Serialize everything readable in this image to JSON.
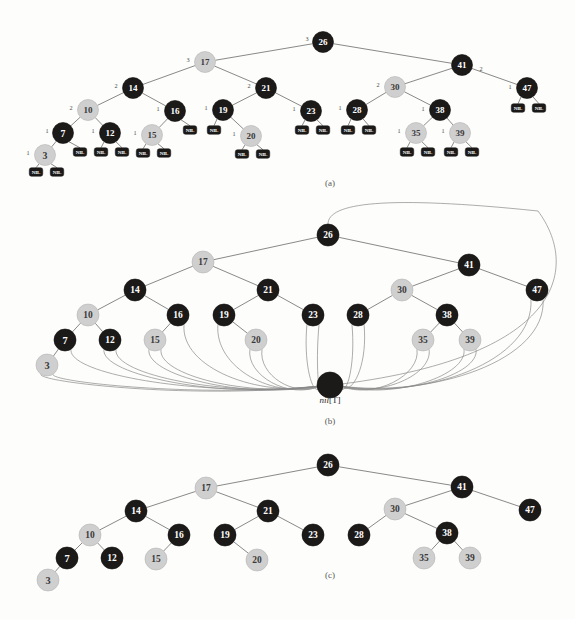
{
  "figure": {
    "captions": [
      {
        "id": "caption-a",
        "text": "(a)",
        "x": 330,
        "y": 186
      },
      {
        "id": "caption-b",
        "text": "(b)",
        "x": 330,
        "y": 424
      },
      {
        "id": "caption-c",
        "text": "(c)",
        "x": 330,
        "y": 578
      }
    ],
    "sentinel_label": {
      "italic_part": "nil",
      "bracket_part": "[T]",
      "x": 330,
      "y": 403
    },
    "colors": {
      "black_node": "#1c1a19",
      "red_node": "#cfcfcf",
      "edge": "#6b6b6b",
      "nil_arc": "#8a8a8a",
      "page_background": "#fdfdfb",
      "black_text": "#ffffff",
      "red_text": "#3a3a3a",
      "bh_text": "#4a4a4a"
    },
    "nil_text": "NIL"
  },
  "panel_a": {
    "name": "panel-a-tree-with-nil-leaves",
    "node_radius": 10.5,
    "nodes": [
      {
        "key": "26",
        "color": "black",
        "x": 323,
        "y": 42,
        "bh": "3",
        "bh_x": 307,
        "bh_y": 38
      },
      {
        "key": "17",
        "color": "red",
        "x": 205,
        "y": 62,
        "bh": "3",
        "bh_x": 188,
        "bh_y": 59
      },
      {
        "key": "41",
        "color": "black",
        "x": 462,
        "y": 65,
        "bh": "2",
        "bh_x": 481,
        "bh_y": 68
      },
      {
        "key": "14",
        "color": "black",
        "x": 133,
        "y": 88,
        "bh": "2",
        "bh_x": 116,
        "bh_y": 85
      },
      {
        "key": "21",
        "color": "black",
        "x": 266,
        "y": 88,
        "bh": "2",
        "bh_x": 249,
        "bh_y": 85
      },
      {
        "key": "30",
        "color": "red",
        "x": 395,
        "y": 87,
        "bh": "2",
        "bh_x": 378,
        "bh_y": 84
      },
      {
        "key": "47",
        "color": "black",
        "x": 527,
        "y": 88,
        "bh": "1",
        "bh_x": 510,
        "bh_y": 86
      },
      {
        "key": "10",
        "color": "red",
        "x": 88,
        "y": 110,
        "bh": "2",
        "bh_x": 71,
        "bh_y": 107
      },
      {
        "key": "16",
        "color": "black",
        "x": 175,
        "y": 111,
        "bh": "1",
        "bh_x": 158,
        "bh_y": 108
      },
      {
        "key": "19",
        "color": "black",
        "x": 223,
        "y": 110,
        "bh": "1",
        "bh_x": 206,
        "bh_y": 107
      },
      {
        "key": "23",
        "color": "black",
        "x": 311,
        "y": 111,
        "bh": "1",
        "bh_x": 294,
        "bh_y": 108
      },
      {
        "key": "28",
        "color": "black",
        "x": 357,
        "y": 110,
        "bh": "1",
        "bh_x": 340,
        "bh_y": 107
      },
      {
        "key": "38",
        "color": "black",
        "x": 440,
        "y": 110,
        "bh": "1",
        "bh_x": 423,
        "bh_y": 108
      },
      {
        "key": "7",
        "color": "black",
        "x": 63,
        "y": 133,
        "bh": "1",
        "bh_x": 47,
        "bh_y": 130
      },
      {
        "key": "12",
        "color": "black",
        "x": 110,
        "y": 133,
        "bh": "1",
        "bh_x": 93,
        "bh_y": 130
      },
      {
        "key": "15",
        "color": "red",
        "x": 152,
        "y": 135,
        "bh": "1",
        "bh_x": 135,
        "bh_y": 132
      },
      {
        "key": "20",
        "color": "red",
        "x": 251,
        "y": 136,
        "bh": "1",
        "bh_x": 234,
        "bh_y": 133
      },
      {
        "key": "35",
        "color": "red",
        "x": 416,
        "y": 133,
        "bh": "1",
        "bh_x": 399,
        "bh_y": 130
      },
      {
        "key": "39",
        "color": "red",
        "x": 460,
        "y": 133,
        "bh": "1",
        "bh_x": 443,
        "bh_y": 130
      },
      {
        "key": "3",
        "color": "red",
        "x": 45,
        "y": 155,
        "bh": "1",
        "bh_x": 28,
        "bh_y": 152
      }
    ],
    "edges": [
      [
        "26",
        "17"
      ],
      [
        "26",
        "41"
      ],
      [
        "17",
        "14"
      ],
      [
        "17",
        "21"
      ],
      [
        "41",
        "30"
      ],
      [
        "41",
        "47"
      ],
      [
        "14",
        "10"
      ],
      [
        "14",
        "16"
      ],
      [
        "21",
        "19"
      ],
      [
        "21",
        "23"
      ],
      [
        "30",
        "28"
      ],
      [
        "30",
        "38"
      ],
      [
        "10",
        "7"
      ],
      [
        "10",
        "12"
      ],
      [
        "16",
        "15"
      ],
      [
        "19",
        "20"
      ],
      [
        "38",
        "35"
      ],
      [
        "38",
        "39"
      ],
      [
        "7",
        "3"
      ]
    ],
    "nil_leaves": [
      {
        "parent": "3",
        "side": "left",
        "x": 36,
        "y": 172
      },
      {
        "parent": "3",
        "side": "right",
        "x": 57,
        "y": 172
      },
      {
        "parent": "7",
        "side": "right",
        "x": 80,
        "y": 152
      },
      {
        "parent": "12",
        "side": "left",
        "x": 101,
        "y": 152
      },
      {
        "parent": "12",
        "side": "right",
        "x": 122,
        "y": 152
      },
      {
        "parent": "15",
        "side": "left",
        "x": 143,
        "y": 153
      },
      {
        "parent": "15",
        "side": "right",
        "x": 164,
        "y": 153
      },
      {
        "parent": "16",
        "side": "right",
        "x": 190,
        "y": 130
      },
      {
        "parent": "19",
        "side": "left",
        "x": 214,
        "y": 130
      },
      {
        "parent": "20",
        "side": "left",
        "x": 242,
        "y": 154
      },
      {
        "parent": "20",
        "side": "right",
        "x": 263,
        "y": 154
      },
      {
        "parent": "23",
        "side": "left",
        "x": 302,
        "y": 130
      },
      {
        "parent": "23",
        "side": "right",
        "x": 323,
        "y": 130
      },
      {
        "parent": "28",
        "side": "left",
        "x": 348,
        "y": 130
      },
      {
        "parent": "28",
        "side": "right",
        "x": 369,
        "y": 130
      },
      {
        "parent": "35",
        "side": "left",
        "x": 407,
        "y": 152
      },
      {
        "parent": "35",
        "side": "right",
        "x": 428,
        "y": 152
      },
      {
        "parent": "39",
        "side": "left",
        "x": 451,
        "y": 152
      },
      {
        "parent": "39",
        "side": "right",
        "x": 472,
        "y": 152
      },
      {
        "parent": "47",
        "side": "left",
        "x": 518,
        "y": 108
      },
      {
        "parent": "47",
        "side": "right",
        "x": 539,
        "y": 108
      }
    ]
  },
  "panel_b": {
    "name": "panel-b-tree-with-sentinel",
    "node_radius": 11,
    "sentinel": {
      "x": 330,
      "y": 385,
      "radius": 13,
      "label": "nil[T]"
    },
    "nodes": [
      {
        "key": "26",
        "color": "black",
        "x": 328,
        "y": 235
      },
      {
        "key": "17",
        "color": "red",
        "x": 203,
        "y": 262
      },
      {
        "key": "41",
        "color": "black",
        "x": 469,
        "y": 265
      },
      {
        "key": "14",
        "color": "black",
        "x": 135,
        "y": 290
      },
      {
        "key": "21",
        "color": "black",
        "x": 268,
        "y": 290
      },
      {
        "key": "30",
        "color": "red",
        "x": 402,
        "y": 290
      },
      {
        "key": "47",
        "color": "black",
        "x": 537,
        "y": 290
      },
      {
        "key": "10",
        "color": "red",
        "x": 88,
        "y": 315
      },
      {
        "key": "16",
        "color": "black",
        "x": 178,
        "y": 315
      },
      {
        "key": "19",
        "color": "black",
        "x": 224,
        "y": 315
      },
      {
        "key": "23",
        "color": "black",
        "x": 313,
        "y": 315
      },
      {
        "key": "28",
        "color": "black",
        "x": 358,
        "y": 315
      },
      {
        "key": "38",
        "color": "black",
        "x": 447,
        "y": 315
      },
      {
        "key": "7",
        "color": "black",
        "x": 65,
        "y": 340
      },
      {
        "key": "12",
        "color": "black",
        "x": 110,
        "y": 340
      },
      {
        "key": "15",
        "color": "red",
        "x": 155,
        "y": 340
      },
      {
        "key": "20",
        "color": "red",
        "x": 256,
        "y": 340
      },
      {
        "key": "35",
        "color": "red",
        "x": 423,
        "y": 340
      },
      {
        "key": "39",
        "color": "red",
        "x": 470,
        "y": 340
      },
      {
        "key": "3",
        "color": "red",
        "x": 47,
        "y": 365
      }
    ],
    "edges": [
      [
        "26",
        "17"
      ],
      [
        "26",
        "41"
      ],
      [
        "17",
        "14"
      ],
      [
        "17",
        "21"
      ],
      [
        "41",
        "30"
      ],
      [
        "41",
        "47"
      ],
      [
        "14",
        "10"
      ],
      [
        "14",
        "16"
      ],
      [
        "21",
        "19"
      ],
      [
        "21",
        "23"
      ],
      [
        "30",
        "28"
      ],
      [
        "30",
        "38"
      ],
      [
        "10",
        "7"
      ],
      [
        "10",
        "12"
      ],
      [
        "16",
        "15"
      ],
      [
        "19",
        "20"
      ],
      [
        "38",
        "35"
      ],
      [
        "38",
        "39"
      ],
      [
        "7",
        "3"
      ]
    ],
    "sentinel_links": [
      {
        "from": "3",
        "side": "left"
      },
      {
        "from": "3",
        "side": "right"
      },
      {
        "from": "7",
        "side": "right"
      },
      {
        "from": "12",
        "side": "left"
      },
      {
        "from": "12",
        "side": "right"
      },
      {
        "from": "15",
        "side": "left"
      },
      {
        "from": "15",
        "side": "right"
      },
      {
        "from": "16",
        "side": "right"
      },
      {
        "from": "19",
        "side": "left"
      },
      {
        "from": "20",
        "side": "left"
      },
      {
        "from": "20",
        "side": "right"
      },
      {
        "from": "23",
        "side": "left"
      },
      {
        "from": "23",
        "side": "right"
      },
      {
        "from": "28",
        "side": "left"
      },
      {
        "from": "28",
        "side": "right"
      },
      {
        "from": "35",
        "side": "left"
      },
      {
        "from": "35",
        "side": "right"
      },
      {
        "from": "39",
        "side": "left"
      },
      {
        "from": "39",
        "side": "right"
      },
      {
        "from": "47",
        "side": "left"
      },
      {
        "from": "47",
        "side": "right"
      }
    ],
    "root_parent_link": {
      "from": "26",
      "note": "root parent points to sentinel via top arc"
    }
  },
  "panel_c": {
    "name": "panel-c-tree-nil-omitted",
    "node_radius": 11,
    "nodes": [
      {
        "key": "26",
        "color": "black",
        "x": 328,
        "y": 465
      },
      {
        "key": "17",
        "color": "red",
        "x": 206,
        "y": 488
      },
      {
        "key": "41",
        "color": "black",
        "x": 462,
        "y": 487
      },
      {
        "key": "14",
        "color": "black",
        "x": 136,
        "y": 511
      },
      {
        "key": "21",
        "color": "black",
        "x": 268,
        "y": 511
      },
      {
        "key": "30",
        "color": "red",
        "x": 395,
        "y": 509
      },
      {
        "key": "47",
        "color": "black",
        "x": 530,
        "y": 510
      },
      {
        "key": "10",
        "color": "red",
        "x": 90,
        "y": 535
      },
      {
        "key": "16",
        "color": "black",
        "x": 179,
        "y": 535
      },
      {
        "key": "19",
        "color": "black",
        "x": 225,
        "y": 535
      },
      {
        "key": "23",
        "color": "black",
        "x": 313,
        "y": 535
      },
      {
        "key": "28",
        "color": "black",
        "x": 359,
        "y": 535
      },
      {
        "key": "38",
        "color": "black",
        "x": 447,
        "y": 533
      },
      {
        "key": "7",
        "color": "black",
        "x": 67,
        "y": 558
      },
      {
        "key": "12",
        "color": "black",
        "x": 112,
        "y": 558
      },
      {
        "key": "15",
        "color": "red",
        "x": 156,
        "y": 559
      },
      {
        "key": "20",
        "color": "red",
        "x": 257,
        "y": 560
      },
      {
        "key": "35",
        "color": "red",
        "x": 424,
        "y": 558
      },
      {
        "key": "39",
        "color": "red",
        "x": 470,
        "y": 558
      },
      {
        "key": "3",
        "color": "red",
        "x": 48,
        "y": 580
      }
    ],
    "edges": [
      [
        "26",
        "17"
      ],
      [
        "26",
        "41"
      ],
      [
        "17",
        "14"
      ],
      [
        "17",
        "21"
      ],
      [
        "41",
        "30"
      ],
      [
        "41",
        "47"
      ],
      [
        "14",
        "10"
      ],
      [
        "14",
        "16"
      ],
      [
        "21",
        "19"
      ],
      [
        "21",
        "23"
      ],
      [
        "30",
        "28"
      ],
      [
        "30",
        "38"
      ],
      [
        "10",
        "7"
      ],
      [
        "10",
        "12"
      ],
      [
        "16",
        "15"
      ],
      [
        "19",
        "20"
      ],
      [
        "38",
        "35"
      ],
      [
        "38",
        "39"
      ],
      [
        "7",
        "3"
      ]
    ]
  }
}
